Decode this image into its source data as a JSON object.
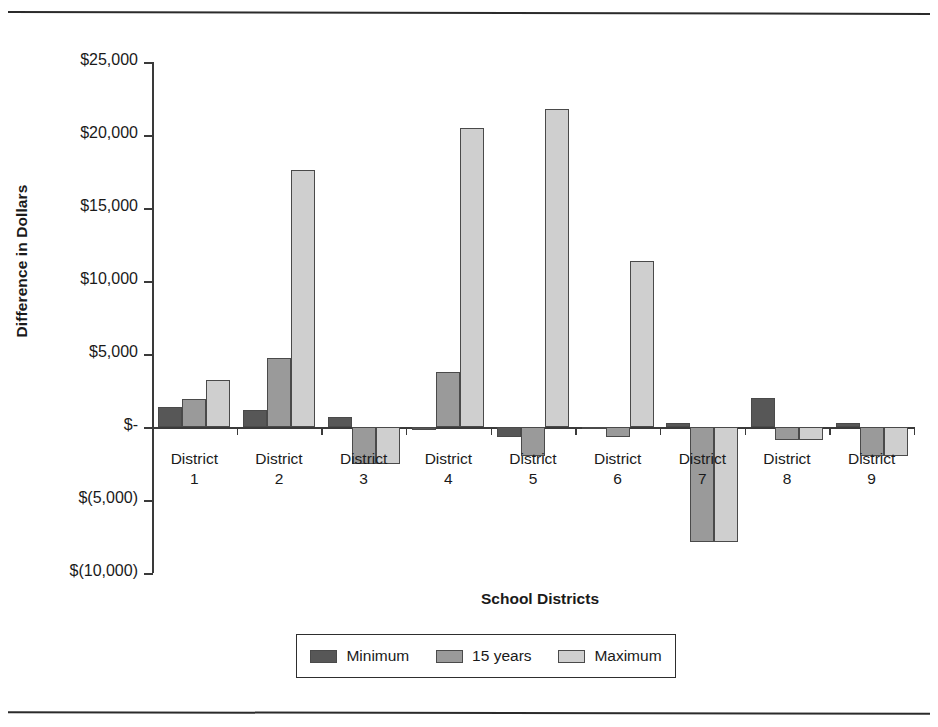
{
  "page": {
    "top_crumb": "",
    "rule_color": "#2b2b2b"
  },
  "chart_data": {
    "type": "bar",
    "title": "",
    "xlabel": "School Districts",
    "ylabel": "Difference in Dollars",
    "categories": [
      "District\n1",
      "District\n2",
      "District\n3",
      "District\n4",
      "District\n5",
      "District\n6",
      "District\n7",
      "District\n8",
      "District\n9"
    ],
    "category_lines": [
      [
        "District",
        "1"
      ],
      [
        "District",
        "2"
      ],
      [
        "District",
        "3"
      ],
      [
        "District",
        "4"
      ],
      [
        "District",
        "5"
      ],
      [
        "District",
        "6"
      ],
      [
        "District",
        "7"
      ],
      [
        "District",
        "8"
      ],
      [
        "District",
        "9"
      ]
    ],
    "series": [
      {
        "name": "Minimum",
        "color": "#575757",
        "values": [
          1400,
          1150,
          700,
          -200,
          -700,
          -150,
          250,
          2000,
          300
        ]
      },
      {
        "name": "15 years",
        "color": "#9a9a9a",
        "values": [
          1950,
          4700,
          -2550,
          3800,
          -2000,
          -700,
          -7900,
          -900,
          -2000
        ]
      },
      {
        "name": "Maximum",
        "color": "#cfcfcf",
        "values": [
          3250,
          17600,
          -2550,
          20500,
          21800,
          11350,
          -7900,
          -900,
          -2000
        ]
      }
    ],
    "ytick_labels": [
      "$25,000",
      "$20,000",
      "$15,000",
      "$10,000",
      "$5,000",
      "$-",
      "$(5,000)",
      "$(10,000)"
    ],
    "ytick_values": [
      25000,
      20000,
      15000,
      10000,
      5000,
      0,
      -5000,
      -10000
    ],
    "ylim": [
      -10000,
      25000
    ],
    "grid": false,
    "legend_position": "bottom"
  },
  "legend": {
    "items": [
      {
        "label": "Minimum"
      },
      {
        "label": "15 years"
      },
      {
        "label": "Maximum"
      }
    ]
  }
}
